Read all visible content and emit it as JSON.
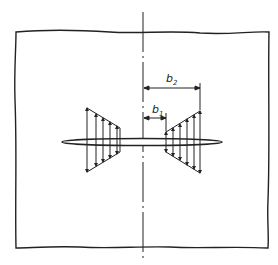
{
  "diagram": {
    "labels": {
      "b1": {
        "base": "b",
        "sub": "1"
      },
      "b2": {
        "base": "b",
        "sub": "2"
      }
    },
    "colors": {
      "ink": "#222222",
      "background": "#ffffff"
    }
  }
}
